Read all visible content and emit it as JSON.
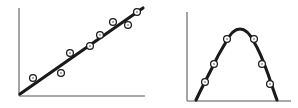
{
  "figure": {
    "title": "",
    "width": 298,
    "height": 108,
    "background_color": "#ffffff",
    "panel_count": 2
  },
  "style": {
    "axis_color": "#8e8e8e",
    "trend_line_color": "#1a1a1a",
    "marker_fill_color": "#ffffff",
    "marker_edge_color": "#1a1a1a",
    "marker_center_color": "#9a9a9a",
    "axis_stroke_width": 1.6,
    "trend_stroke_width": 3.1,
    "marker_radius": 3.4
  },
  "chart_data": [
    {
      "type": "scatter",
      "name": "linear-relationship",
      "title": "",
      "subtitle": "",
      "xlabel": "",
      "ylabel": "",
      "xlim": [
        0,
        100
      ],
      "ylim": [
        0,
        100
      ],
      "grid": false,
      "legend": false,
      "legend_position": "none",
      "axes": {
        "y_axis": {
          "x": 19,
          "y_top": 8,
          "y_bottom": 96
        },
        "x_axis": {
          "y": 96,
          "x_left": 19,
          "x_right": 145
        }
      },
      "points_px": [
        {
          "x": 33,
          "y": 78
        },
        {
          "x": 61,
          "y": 73
        },
        {
          "x": 70,
          "y": 53
        },
        {
          "x": 90,
          "y": 46
        },
        {
          "x": 100,
          "y": 35
        },
        {
          "x": 113,
          "y": 22
        },
        {
          "x": 128,
          "y": 25
        },
        {
          "x": 137,
          "y": 12
        }
      ],
      "points": [
        {
          "x": 11,
          "y": 20
        },
        {
          "x": 33,
          "y": 26
        },
        {
          "x": 40,
          "y": 49
        },
        {
          "x": 56,
          "y": 57
        },
        {
          "x": 64,
          "y": 69
        },
        {
          "x": 75,
          "y": 84
        },
        {
          "x": 87,
          "y": 81
        },
        {
          "x": 94,
          "y": 95
        }
      ],
      "fit": {
        "kind": "linear",
        "path_px": [
          {
            "x": 20,
            "y": 94
          },
          {
            "x": 143,
            "y": 8
          }
        ]
      }
    },
    {
      "type": "scatter",
      "name": "curvilinear-relationship",
      "title": "",
      "subtitle": "",
      "xlabel": "",
      "ylabel": "",
      "xlim": [
        0,
        100
      ],
      "ylim": [
        0,
        100
      ],
      "grid": false,
      "legend": false,
      "legend_position": "none",
      "axes": {
        "y_axis": {
          "x": 38,
          "y_top": 12,
          "y_bottom": 101
        },
        "x_axis": {
          "y": 101,
          "x_left": 38,
          "x_right": 142
        }
      },
      "points_px": [
        {
          "x": 56,
          "y": 82
        },
        {
          "x": 65,
          "y": 64
        },
        {
          "x": 78,
          "y": 39
        },
        {
          "x": 105,
          "y": 39
        },
        {
          "x": 113,
          "y": 64
        },
        {
          "x": 121,
          "y": 84
        }
      ],
      "points": [
        {
          "x": 17,
          "y": 21
        },
        {
          "x": 26,
          "y": 42
        },
        {
          "x": 38,
          "y": 70
        },
        {
          "x": 64,
          "y": 70
        },
        {
          "x": 72,
          "y": 42
        },
        {
          "x": 80,
          "y": 19
        }
      ],
      "fit": {
        "kind": "quadratic",
        "peak_px": {
          "x": 91,
          "y": 29
        },
        "path_px": [
          {
            "x": 47,
            "y": 100
          },
          {
            "x": 62,
            "y": 70
          },
          {
            "x": 74,
            "y": 46
          },
          {
            "x": 83,
            "y": 32
          },
          {
            "x": 91,
            "y": 29
          },
          {
            "x": 100,
            "y": 32
          },
          {
            "x": 109,
            "y": 47
          },
          {
            "x": 120,
            "y": 77
          },
          {
            "x": 128,
            "y": 100
          }
        ]
      }
    }
  ]
}
